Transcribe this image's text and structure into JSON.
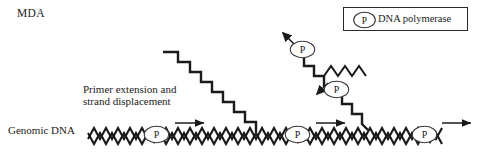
{
  "figure": {
    "title": "MDA",
    "type": "process-diagram"
  },
  "legend": {
    "symbol_letter": "P",
    "symbol_name": "polymerase-ellipse-icon",
    "label": "DNA polymerase"
  },
  "labels": {
    "genomic_dna": "Genomic DNA",
    "primer_line1": "Primer extension and",
    "primer_line2": "strand displacement"
  },
  "colors": {
    "ink": "#1a1a1a",
    "stroke": "#2a2a2a",
    "background": "#ffffff"
  },
  "polymerases": [
    {
      "id": "p-template-1",
      "letter": "P",
      "x": 156,
      "y": 134,
      "location": "on-genomic-dna"
    },
    {
      "id": "p-template-2",
      "letter": "P",
      "x": 297,
      "y": 134,
      "location": "on-genomic-dna"
    },
    {
      "id": "p-template-3",
      "letter": "P",
      "x": 424,
      "y": 134,
      "location": "on-genomic-dna"
    },
    {
      "id": "p-displaced-1",
      "letter": "P",
      "x": 301,
      "y": 49,
      "location": "on-displaced-strand"
    },
    {
      "id": "p-displaced-2",
      "letter": "P",
      "x": 335,
      "y": 89,
      "location": "on-displaced-strand"
    }
  ],
  "arrows": {
    "horizontal": [
      {
        "id": "arrow-synthesis-1",
        "x1": 175,
        "y": 123,
        "x2": 205
      },
      {
        "id": "arrow-synthesis-2",
        "x1": 316,
        "y": 123,
        "x2": 345
      },
      {
        "id": "arrow-synthesis-3",
        "x1": 442,
        "y": 123,
        "x2": 472
      }
    ],
    "diagonal": [
      {
        "id": "arrow-displacement-1",
        "x1": 293,
        "y1": 43,
        "x2": 282,
        "y2": 33
      },
      {
        "id": "arrow-displacement-2",
        "x1": 327,
        "y1": 84,
        "x2": 316,
        "y2": 94
      }
    ]
  },
  "strands": {
    "genomic_dna_note": "double interlocking zigzag spanning the lower width",
    "displaced_note": "staircase strands rising to upper left with zigzag tails"
  }
}
